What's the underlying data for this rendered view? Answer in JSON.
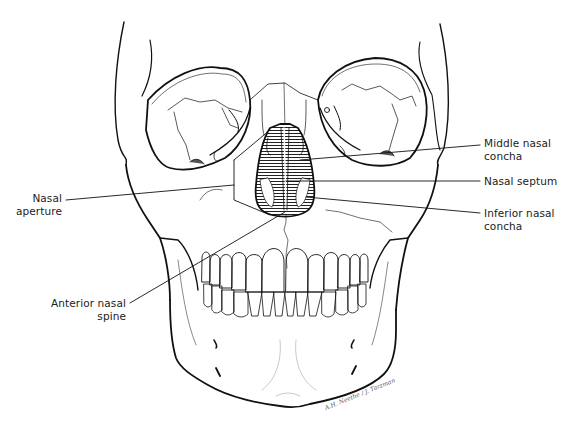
{
  "figure": {
    "labels": {
      "middle_nasal_concha": {
        "line1": "Middle nasal",
        "line2": "concha"
      },
      "nasal_septum": {
        "line1": "Nasal septum"
      },
      "inferior_nasal_concha": {
        "line1": "Inferior nasal",
        "line2": "concha"
      },
      "nasal_aperture": {
        "line1": "Nasal",
        "line2": "aperture"
      },
      "anterior_nasal_spine": {
        "line1": "Anterior nasal",
        "line2": "spine"
      }
    },
    "signature": "A.H. Neethe / J. Tarzman",
    "colors": {
      "ink": "#111111",
      "shade": "#555555",
      "background": "#ffffff"
    }
  }
}
